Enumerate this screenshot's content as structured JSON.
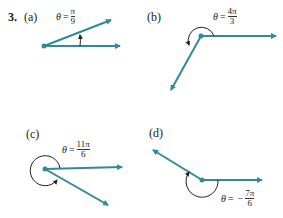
{
  "problem": {
    "number": "3.",
    "color_ray": "#2e8b9a",
    "color_arc": "#222222",
    "parts": [
      {
        "label": "(a)",
        "theta_symbol": "θ",
        "equals": "=",
        "sign": "",
        "numerator": "π",
        "denominator": "9"
      },
      {
        "label": "(b)",
        "theta_symbol": "θ",
        "equals": "=",
        "sign": "",
        "numerator": "4π",
        "denominator": "3"
      },
      {
        "label": "(c)",
        "theta_symbol": "θ",
        "equals": "=",
        "sign": "",
        "numerator": "11π",
        "denominator": "6"
      },
      {
        "label": "(d)",
        "theta_symbol": "θ",
        "equals": "=",
        "sign": "−",
        "numerator": "7π",
        "denominator": "6"
      }
    ]
  }
}
